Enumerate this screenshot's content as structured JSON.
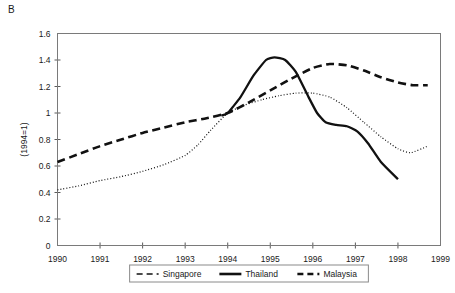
{
  "panel": {
    "label": "B"
  },
  "chart_data": {
    "type": "line",
    "title": "",
    "xlabel": "",
    "ylabel": "(1994=1)",
    "xlim": [
      1990,
      1999
    ],
    "ylim": [
      0,
      1.6
    ],
    "grid": false,
    "legend_position": "bottom",
    "x_ticks": [
      "1990",
      "1991",
      "1992",
      "1993",
      "1994",
      "1995",
      "1996",
      "1997",
      "1998",
      "1999"
    ],
    "y_ticks": [
      "0",
      "0.2",
      "0.4",
      "0.6",
      "0.8",
      "1",
      "1.2",
      "1.4",
      "1.6"
    ],
    "series": [
      {
        "name": "Singapore",
        "style": "dotted",
        "x": [
          1990,
          1990.5,
          1991,
          1991.5,
          1992,
          1992.5,
          1993,
          1993.3,
          1993.6,
          1994,
          1994.4,
          1994.8,
          1995.2,
          1995.6,
          1996,
          1996.4,
          1996.8,
          1997.2,
          1997.6,
          1998,
          1998.3,
          1998.7
        ],
        "values": [
          0.42,
          0.45,
          0.49,
          0.52,
          0.56,
          0.61,
          0.68,
          0.76,
          0.87,
          1.0,
          1.06,
          1.1,
          1.13,
          1.15,
          1.15,
          1.12,
          1.04,
          0.93,
          0.82,
          0.73,
          0.7,
          0.75
        ]
      },
      {
        "name": "Thailand",
        "style": "solid",
        "x": [
          1993.85,
          1994,
          1994.3,
          1994.6,
          1994.9,
          1995.1,
          1995.35,
          1995.6,
          1995.9,
          1996.1,
          1996.3,
          1996.55,
          1996.8,
          1997.05,
          1997.3,
          1997.6,
          1998
        ],
        "values": [
          0.98,
          1.0,
          1.12,
          1.28,
          1.4,
          1.42,
          1.4,
          1.31,
          1.12,
          1.0,
          0.93,
          0.91,
          0.9,
          0.86,
          0.77,
          0.63,
          0.5
        ]
      },
      {
        "name": "Malaysia",
        "style": "dashed",
        "x": [
          1990,
          1990.5,
          1991,
          1991.5,
          1992,
          1992.5,
          1993,
          1993.5,
          1994,
          1994.5,
          1995,
          1995.5,
          1996,
          1996.4,
          1996.8,
          1997.2,
          1997.6,
          1998,
          1998.35,
          1998.7
        ],
        "values": [
          0.63,
          0.69,
          0.75,
          0.8,
          0.85,
          0.89,
          0.93,
          0.96,
          1.0,
          1.08,
          1.17,
          1.26,
          1.34,
          1.37,
          1.36,
          1.32,
          1.27,
          1.23,
          1.21,
          1.21
        ]
      }
    ]
  },
  "legend": {
    "items": [
      {
        "label": "Singapore",
        "style": "dashed-thin"
      },
      {
        "label": "Thailand",
        "style": "solid-thick"
      },
      {
        "label": "Malaysia",
        "style": "dashed-thick"
      }
    ]
  },
  "colors": {
    "line": "#111111",
    "frame": "#7a7a7a",
    "text": "#1a1a1a",
    "background": "#ffffff"
  }
}
